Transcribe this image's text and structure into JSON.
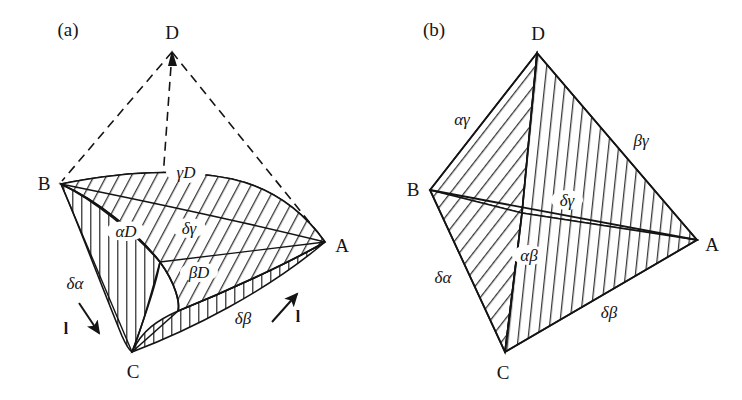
{
  "figure": {
    "type": "diagram",
    "background_color": "#ffffff",
    "line_color": "#141414"
  },
  "panels": [
    {
      "id": "a",
      "tag": "(a)",
      "tag_pos": {
        "x": 68,
        "y": 29
      },
      "vertices": [
        {
          "name": "D",
          "label": "D",
          "x": 172,
          "y": 50,
          "label_x": 172,
          "label_y": 32
        },
        {
          "name": "B",
          "label": "B",
          "x": 61,
          "y": 184,
          "label_x": 44,
          "label_y": 183
        },
        {
          "name": "A",
          "label": "A",
          "x": 325,
          "y": 242,
          "label_x": 342,
          "label_y": 245
        },
        {
          "name": "C",
          "label": "C",
          "x": 132,
          "y": 352,
          "label_x": 133,
          "label_y": 371
        }
      ],
      "face_labels": [
        {
          "name": "gamma-D",
          "text": "γD",
          "x": 186,
          "y": 172
        },
        {
          "name": "alpha-D",
          "text": "αD",
          "x": 126,
          "y": 231
        },
        {
          "name": "delta-gamma",
          "text": "δγ",
          "x": 189,
          "y": 228
        },
        {
          "name": "beta-D",
          "text": "βD",
          "x": 199,
          "y": 272
        },
        {
          "name": "delta-alpha",
          "text": "δα",
          "x": 75,
          "y": 283
        },
        {
          "name": "delta-beta",
          "text": "δβ",
          "x": 243,
          "y": 318
        }
      ],
      "arrows": [
        {
          "name": "slip-arrow-left",
          "label": "l",
          "label_x": 66,
          "label_y": 329,
          "x1": 79,
          "y1": 303,
          "x2": 101,
          "y2": 335
        },
        {
          "name": "slip-arrow-right",
          "label": "l",
          "label_x": 298,
          "label_y": 317,
          "x1": 272,
          "y1": 322,
          "x2": 299,
          "y2": 292
        }
      ]
    },
    {
      "id": "b",
      "tag": "(b)",
      "tag_pos": {
        "x": 434,
        "y": 29
      },
      "vertices": [
        {
          "name": "D",
          "label": "D",
          "x": 537,
          "y": 53,
          "label_x": 538,
          "label_y": 33
        },
        {
          "name": "B",
          "label": "B",
          "x": 430,
          "y": 190,
          "label_x": 413,
          "label_y": 189
        },
        {
          "name": "A",
          "label": "A",
          "x": 697,
          "y": 240,
          "label_x": 712,
          "label_y": 244
        },
        {
          "name": "C",
          "label": "C",
          "x": 505,
          "y": 352,
          "label_x": 503,
          "label_y": 372
        }
      ],
      "interior_node": {
        "name": "delta-node",
        "x": 522,
        "y": 213
      },
      "face_labels": [
        {
          "name": "alpha-gamma",
          "text": "αγ",
          "x": 462,
          "y": 119
        },
        {
          "name": "beta-gamma",
          "text": "βγ",
          "x": 641,
          "y": 140
        },
        {
          "name": "delta-gamma",
          "text": "δγ",
          "x": 567,
          "y": 200
        },
        {
          "name": "alpha-beta",
          "text": "αβ",
          "x": 529,
          "y": 255
        },
        {
          "name": "delta-alpha",
          "text": "δα",
          "x": 443,
          "y": 277
        },
        {
          "name": "delta-beta",
          "text": "δβ",
          "x": 609,
          "y": 312
        }
      ]
    }
  ]
}
